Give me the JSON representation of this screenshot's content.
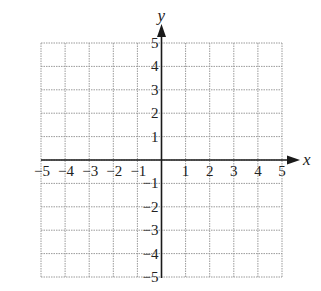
{
  "chart_data": {
    "type": "coordinate-grid",
    "title": "",
    "xlabel": "x",
    "ylabel": "y",
    "xlim": [
      -5,
      5
    ],
    "ylim": [
      -5,
      5
    ],
    "grid": true,
    "grid_style": "dotted",
    "x_ticks": [
      "−5",
      "−4",
      "−3",
      "−2",
      "−1",
      "1",
      "2",
      "3",
      "4",
      "5"
    ],
    "x_tick_values": [
      -5,
      -4,
      -3,
      -2,
      -1,
      1,
      2,
      3,
      4,
      5
    ],
    "y_ticks": [
      "5",
      "4",
      "3",
      "2",
      "1",
      "−1",
      "−2",
      "−3",
      "−4",
      "−5"
    ],
    "y_tick_values": [
      5,
      4,
      3,
      2,
      1,
      -1,
      -2,
      -3,
      -4,
      -5
    ],
    "series": []
  },
  "colors": {
    "grid": "#9a9a9a",
    "axis": "#1a1a1a",
    "text": "#222222",
    "background": "#ffffff"
  },
  "layout": {
    "left": 41,
    "right": 282,
    "top": 43,
    "bottom": 277,
    "origin_x": 161,
    "origin_y": 160
  }
}
